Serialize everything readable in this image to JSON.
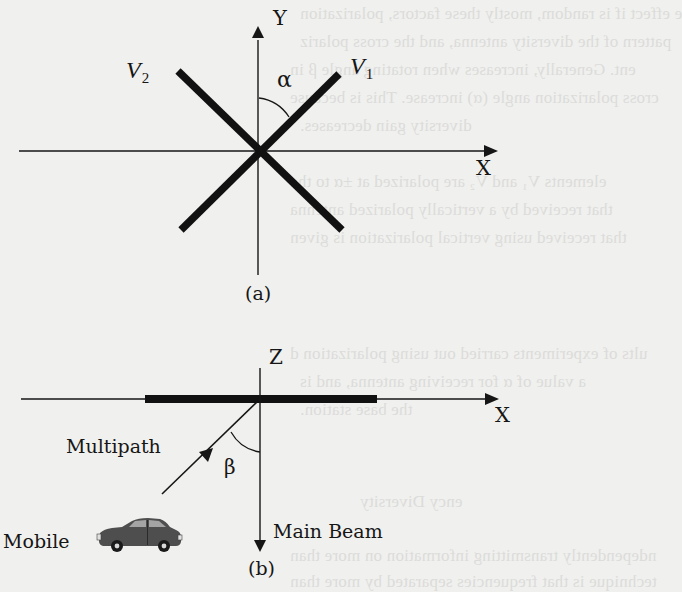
{
  "figure": {
    "diagram_a": {
      "caption": "(a)",
      "axis_y_label": "Y",
      "axis_x_label": "X",
      "antenna_1_label": "V",
      "antenna_1_subscript": "1",
      "antenna_2_label": "V",
      "antenna_2_subscript": "2",
      "angle_label": "α"
    },
    "diagram_b": {
      "caption": "(b)",
      "axis_z_label": "Z",
      "axis_x_label": "X",
      "multipath_label": "Multipath",
      "angle_label": "β",
      "main_beam_label": "Main Beam",
      "mobile_label": "Mobile"
    }
  },
  "bleed_through_text": [
    "e effect if is random, mostly these factors, polarization",
    "pattern of the diversity antenna, and the cross polariz",
    "ent. Generally, increases when rotating angle β in",
    "cross polarization angle (α) increase. This is because",
    "diversity gain decreases.",
    "elements V₁ and V₂ are polarized at ±α to the",
    "that received by a vertically polarized antenna",
    "that received using vertical polarization is given",
    "ults of experiments carried out using polarization d",
    "a value of α for receiving antenna, and is",
    "the base station.",
    "ency Diversity",
    "ndependently transmitting information on more than",
    "technique is that frequencies separated by more than"
  ],
  "colors": {
    "background": "#f0f0ee",
    "ink": "#161616",
    "bleed_text": "#dcdcda",
    "car_body": "#4e4e4e",
    "car_window": "#9a9a9a"
  }
}
